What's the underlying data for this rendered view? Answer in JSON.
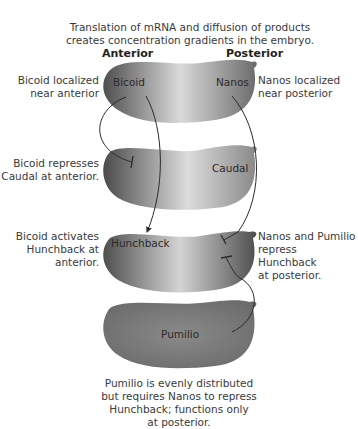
{
  "title": {
    "line1": "Translation of mRNA and diffusion of products",
    "line2": "creates concentration gradients in the embryo."
  },
  "axis_labels": {
    "anterior": "Anterior",
    "posterior": "Posterior"
  },
  "embryos": [
    {
      "labels": [
        "Bicoid",
        "Nanos"
      ]
    },
    {
      "labels": [
        "Caudal"
      ]
    },
    {
      "labels": [
        "Hunchback"
      ]
    },
    {
      "labels": [
        "Pumilio"
      ]
    }
  ],
  "annotations": {
    "bicoid_localized": {
      "line1": "Bicoid localized",
      "line2": "near anterior"
    },
    "nanos_localized": {
      "line1": "Nanos localized",
      "line2": "near posterior"
    },
    "bicoid_represses": {
      "line1": "Bicoid represses",
      "line2": "Caudal at anterior."
    },
    "bicoid_activates": {
      "line1": "Bicoid activates",
      "line2": "Hunchback at",
      "line3": "anterior."
    },
    "nanos_pumilio": {
      "line1": "Nanos and Pumilio",
      "line2": "repress Hunchback",
      "line3": "at posterior."
    },
    "pumilio_caption": {
      "line1": "Pumilio is evenly distributed",
      "line2": "but requires Nanos to repress",
      "line3": "Hunchback; functions only",
      "line4": "at posterior."
    }
  },
  "colors": {
    "embryo_dark": "#5a5a5a",
    "embryo_light": "#d8d8d8",
    "line": "#2b2b2b",
    "pumilio": "#7a7a7a"
  }
}
